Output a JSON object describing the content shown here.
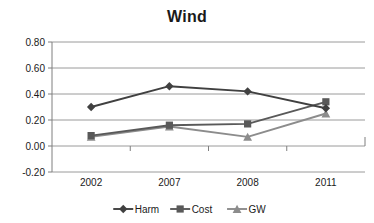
{
  "chart_data": {
    "type": "line",
    "title": "Wind",
    "xlabel": "",
    "ylabel": "",
    "categories": [
      "2002",
      "2007",
      "2008",
      "2011"
    ],
    "ylim": [
      -0.2,
      0.8
    ],
    "yticks": [
      -0.2,
      0.0,
      0.2,
      0.4,
      0.6,
      0.8
    ],
    "ytick_labels": [
      "-0.20",
      "0.00",
      "0.20",
      "0.40",
      "0.60",
      "0.80"
    ],
    "grid": true,
    "legend_position": "bottom",
    "series": [
      {
        "name": "Harm",
        "marker": "diamond",
        "color": "#404040",
        "values": [
          0.3,
          0.46,
          0.42,
          0.29
        ]
      },
      {
        "name": "Cost",
        "marker": "square",
        "color": "#595959",
        "values": [
          0.08,
          0.16,
          0.17,
          0.34
        ]
      },
      {
        "name": "GW",
        "marker": "triangle",
        "color": "#8c8c8c",
        "values": [
          0.07,
          0.15,
          0.07,
          0.25
        ]
      }
    ]
  },
  "colors": {
    "harm": "#404040",
    "cost": "#595959",
    "gw": "#8c8c8c",
    "gridline": "#9a9a9a",
    "axis": "#7f7f7f",
    "text": "#1a1a1a",
    "background": "#ffffff"
  }
}
